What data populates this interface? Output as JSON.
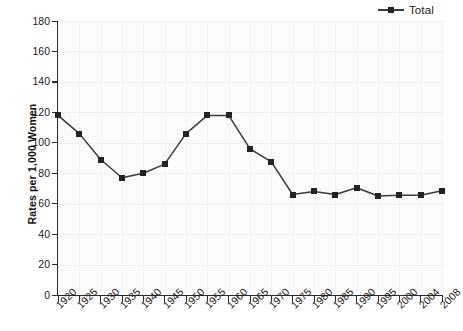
{
  "legend": {
    "position": "top-right",
    "entries": [
      {
        "label": "Total",
        "color": "#232323",
        "marker": "square",
        "icon": "line-marker-icon"
      }
    ]
  },
  "axes": {
    "ylabel": "Rates per 1,000 Women",
    "xlabel": "",
    "y_ticks": [
      "0",
      "20",
      "40",
      "60",
      "80",
      "100",
      "120",
      "140",
      "160",
      "180"
    ],
    "x_ticks": [
      "1920",
      "1925",
      "1930",
      "1935",
      "1940",
      "1945",
      "1950",
      "1955",
      "1960",
      "1965",
      "1970",
      "1975",
      "1980",
      "1985",
      "1990",
      "1995",
      "2000",
      "2004",
      "2008"
    ]
  },
  "chart_data": {
    "type": "line",
    "title": "",
    "subtitle": "",
    "xlabel": "",
    "ylabel": "Rates per 1,000 Women",
    "categories": [
      "1920",
      "1925",
      "1930",
      "1935",
      "1940",
      "1945",
      "1950",
      "1955",
      "1960",
      "1965",
      "1970",
      "1975",
      "1980",
      "1985",
      "1990",
      "1995",
      "2000",
      "2004",
      "2008"
    ],
    "series": [
      {
        "name": "Total",
        "color": "#232323",
        "marker": "square",
        "values": [
          118,
          106,
          89,
          77,
          80,
          86,
          106,
          118,
          118,
          96,
          87.5,
          66,
          68,
          66,
          70.5,
          65,
          65.5,
          65.5,
          68.5
        ]
      }
    ],
    "ylim": [
      0,
      180
    ],
    "ytick_step": 20,
    "grid": true,
    "grid_axis": "both",
    "legend_position": "top-right",
    "legend_entries": [
      "Total"
    ],
    "annotations": []
  },
  "colors": {
    "series_line": "#3a3a3a",
    "series_marker": "#232323",
    "axis": "#2b2b2b",
    "grid": "#f0f0f0",
    "plot_background": "#fbfbfb",
    "page_background": "#ffffff",
    "text": "#1a1a1a"
  }
}
